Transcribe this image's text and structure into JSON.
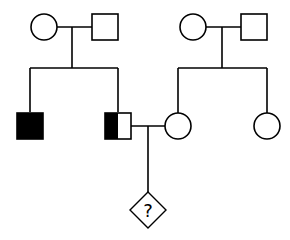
{
  "diagram": {
    "type": "pedigree-chart",
    "colors": {
      "stroke": "#000000",
      "fill_affected": "#000000",
      "fill_unaffected": "#ffffff",
      "background": "#ffffff"
    },
    "individuals": [
      {
        "id": "I-1",
        "sex": "female",
        "status": "unaffected",
        "generation": 1
      },
      {
        "id": "I-2",
        "sex": "male",
        "status": "unaffected",
        "generation": 1
      },
      {
        "id": "I-3",
        "sex": "female",
        "status": "unaffected",
        "generation": 1
      },
      {
        "id": "I-4",
        "sex": "male",
        "status": "unaffected",
        "generation": 1
      },
      {
        "id": "II-1",
        "sex": "male",
        "status": "affected",
        "generation": 2
      },
      {
        "id": "II-2",
        "sex": "male",
        "status": "half-shaded",
        "generation": 2
      },
      {
        "id": "II-3",
        "sex": "female",
        "status": "unaffected",
        "generation": 2
      },
      {
        "id": "II-4",
        "sex": "female",
        "status": "unaffected",
        "generation": 2
      },
      {
        "id": "III-1",
        "sex": "unknown",
        "status": "unknown",
        "generation": 3,
        "label": "?"
      }
    ],
    "unions": [
      {
        "partners": [
          "I-1",
          "I-2"
        ],
        "children": [
          "II-1",
          "II-2"
        ]
      },
      {
        "partners": [
          "I-3",
          "I-4"
        ],
        "children": [
          "II-3",
          "II-4"
        ]
      },
      {
        "partners": [
          "II-2",
          "II-3"
        ],
        "children": [
          "III-1"
        ]
      }
    ],
    "unknown_child_label": "?"
  }
}
